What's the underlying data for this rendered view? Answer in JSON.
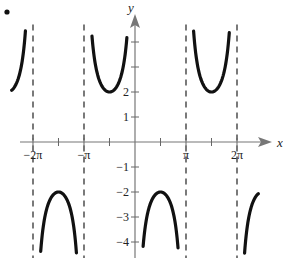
{
  "chart_data": {
    "type": "line",
    "title": "",
    "function": "y = -2 csc(x)",
    "xlabel": "x",
    "ylabel": "y",
    "xlim": [
      -8.2,
      8.6
    ],
    "ylim": [
      -4.4,
      4.6
    ],
    "grid": false,
    "legend": null,
    "x_ticks": [
      {
        "value": -6.2832,
        "label": "-2π"
      },
      {
        "value": -4.7124,
        "label": ""
      },
      {
        "value": -3.1416,
        "label": "-π"
      },
      {
        "value": -1.5708,
        "label": ""
      },
      {
        "value": 1.5708,
        "label": ""
      },
      {
        "value": 3.1416,
        "label": "π"
      },
      {
        "value": 4.7124,
        "label": ""
      },
      {
        "value": 6.2832,
        "label": "2π"
      }
    ],
    "y_ticks": [
      {
        "value": 4,
        "label": ""
      },
      {
        "value": 3,
        "label": ""
      },
      {
        "value": 2,
        "label": "2"
      },
      {
        "value": 1,
        "label": "1"
      },
      {
        "value": -1,
        "label": "-1"
      },
      {
        "value": -2,
        "label": "-2"
      },
      {
        "value": -3,
        "label": "-3"
      },
      {
        "value": -4,
        "label": "-4"
      }
    ],
    "asymptotes": [
      -6.2832,
      -3.1416,
      3.1416,
      6.2832
    ],
    "key_points": [
      {
        "x": -4.7124,
        "y": -2,
        "kind": "local max (downward branch)"
      },
      {
        "x": -1.5708,
        "y": 2,
        "kind": "local min (upward branch)"
      },
      {
        "x": 1.5708,
        "y": -2,
        "kind": "local max (downward branch)"
      },
      {
        "x": 4.7124,
        "y": 2,
        "kind": "local min (upward branch)"
      }
    ],
    "branches": [
      {
        "x_range": [
          -7.6,
          -6.6
        ],
        "direction": "up",
        "note": "partial branch left of -2π"
      },
      {
        "x_range": [
          -6.0,
          -3.45
        ],
        "direction": "down"
      },
      {
        "x_range": [
          -2.65,
          -0.5
        ],
        "direction": "up"
      },
      {
        "x_range": [
          0.5,
          2.65
        ],
        "direction": "down"
      },
      {
        "x_range": [
          3.45,
          6.0
        ],
        "direction": "up"
      },
      {
        "x_range": [
          6.6,
          7.6
        ],
        "direction": "down",
        "note": "partial branch right of 2π"
      }
    ]
  },
  "labels": {
    "x_axis": "x",
    "y_axis": "y",
    "bullet": "•"
  }
}
